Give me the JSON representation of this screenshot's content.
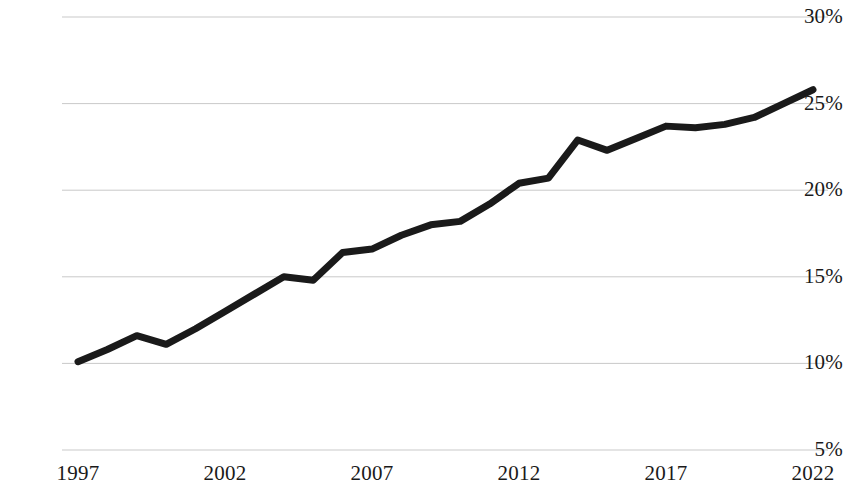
{
  "chart_data": {
    "type": "line",
    "title": "",
    "subtitle": "",
    "xlabel": "",
    "ylabel": "",
    "x": [
      1997,
      1998,
      1999,
      2000,
      2001,
      2002,
      2003,
      2004,
      2005,
      2006,
      2007,
      2008,
      2009,
      2010,
      2011,
      2012,
      2013,
      2014,
      2015,
      2016,
      2017,
      2018,
      2019,
      2020,
      2021,
      2022
    ],
    "values": [
      10.1,
      10.8,
      11.6,
      11.1,
      12.0,
      13.0,
      14.0,
      15.0,
      14.8,
      16.4,
      16.6,
      17.4,
      18.0,
      18.2,
      19.2,
      20.4,
      20.7,
      22.9,
      22.3,
      23.0,
      23.7,
      23.6,
      23.8,
      24.2,
      25.0,
      25.8
    ],
    "series": [
      {
        "name": "",
        "values": [
          10.1,
          10.8,
          11.6,
          11.1,
          12.0,
          13.0,
          14.0,
          15.0,
          14.8,
          16.4,
          16.6,
          17.4,
          18.0,
          18.2,
          19.2,
          20.4,
          20.7,
          22.9,
          22.3,
          23.0,
          23.7,
          23.6,
          23.8,
          24.2,
          25.0,
          25.8
        ],
        "color": "#1a1a1a"
      }
    ],
    "xlim": [
      1997,
      2022
    ],
    "ylim": [
      5,
      30
    ],
    "y_ticks": [
      30,
      25,
      20,
      15,
      10,
      5
    ],
    "y_tick_labels": [
      "30%",
      "25%",
      "20%",
      "15%",
      "10%",
      "5%"
    ],
    "x_ticks": [
      1997,
      2002,
      2007,
      2012,
      2017,
      2022
    ],
    "x_tick_labels": [
      "1997",
      "2002",
      "2007",
      "2012",
      "2017",
      "2022"
    ],
    "grid": true,
    "grid_axis": "y",
    "grid_color": "#c9c9c9",
    "legend": false,
    "legend_position": "none",
    "line_color": "#1a1a1a",
    "line_width": 7,
    "background_color": "#ffffff",
    "annotations": []
  },
  "axis": {
    "y_labels": [
      "30%",
      "25%",
      "20%",
      "15%",
      "10%",
      "5%"
    ],
    "x_labels": [
      "1997",
      "2002",
      "2007",
      "2012",
      "2017",
      "2022"
    ]
  }
}
